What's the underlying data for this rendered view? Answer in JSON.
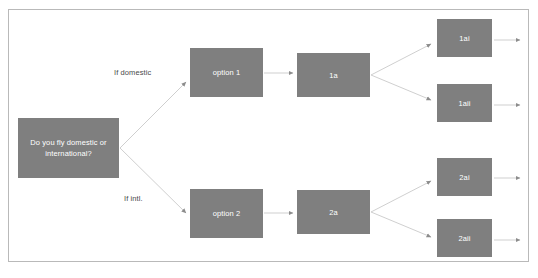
{
  "diagram": {
    "type": "flowchart",
    "title": "",
    "frame": {
      "border_color": "#b9b9b9",
      "background": "#ffffff"
    },
    "node_style": {
      "fill": "#7f7f7f",
      "text_color": "#ffffff"
    },
    "edge_style": {
      "line_color": "#c2c2c2",
      "arrow_color": "#8c8c8c"
    },
    "nodes": [
      {
        "id": "decision",
        "label": "Do you fly domestic or international?",
        "lines": [
          "Do you fly",
          "domestic or",
          "international?"
        ],
        "x": 18,
        "y": 118,
        "w": 101,
        "h": 60
      },
      {
        "id": "option1",
        "label": "option 1",
        "lines": [
          "option 1"
        ],
        "x": 190,
        "y": 48,
        "w": 73,
        "h": 49
      },
      {
        "id": "option2",
        "label": "option 2",
        "lines": [
          "option 2"
        ],
        "x": 190,
        "y": 189,
        "w": 73,
        "h": 49
      },
      {
        "id": "n1a",
        "label": "1a",
        "lines": [
          "1a"
        ],
        "x": 297,
        "y": 53,
        "w": 73,
        "h": 44
      },
      {
        "id": "n2a",
        "label": "2a",
        "lines": [
          "2a"
        ],
        "x": 297,
        "y": 190,
        "w": 73,
        "h": 44
      },
      {
        "id": "n1ai",
        "label": "1ai",
        "lines": [
          "1ai"
        ],
        "x": 437,
        "y": 19,
        "w": 55,
        "h": 38
      },
      {
        "id": "n1aii",
        "label": "1aii",
        "lines": [
          "1aii"
        ],
        "x": 437,
        "y": 84,
        "w": 55,
        "h": 38
      },
      {
        "id": "n2ai",
        "label": "2ai",
        "lines": [
          "2ai"
        ],
        "x": 437,
        "y": 158,
        "w": 55,
        "h": 38
      },
      {
        "id": "n2aii",
        "label": "2aii",
        "lines": [
          "2aii"
        ],
        "x": 437,
        "y": 219,
        "w": 55,
        "h": 38
      }
    ],
    "edge_labels": [
      {
        "id": "if-domestic",
        "text": "If domestic",
        "x": 114,
        "y": 68
      },
      {
        "id": "if-intl",
        "text": "If intl.",
        "x": 124,
        "y": 194
      }
    ],
    "edges": [
      {
        "from": "decision",
        "to": "option1",
        "label": "If domestic"
      },
      {
        "from": "decision",
        "to": "option2",
        "label": "If intl."
      },
      {
        "from": "option1",
        "to": "n1a",
        "label": ""
      },
      {
        "from": "option2",
        "to": "n2a",
        "label": ""
      },
      {
        "from": "n1a",
        "to": "n1ai",
        "label": ""
      },
      {
        "from": "n1a",
        "to": "n1aii",
        "label": ""
      },
      {
        "from": "n2a",
        "to": "n2ai",
        "label": ""
      },
      {
        "from": "n2a",
        "to": "n2aii",
        "label": ""
      },
      {
        "from": "n1ai",
        "to": "out",
        "label": ""
      },
      {
        "from": "n1aii",
        "to": "out",
        "label": ""
      },
      {
        "from": "n2ai",
        "to": "out",
        "label": ""
      },
      {
        "from": "n2aii",
        "to": "out",
        "label": ""
      }
    ]
  }
}
